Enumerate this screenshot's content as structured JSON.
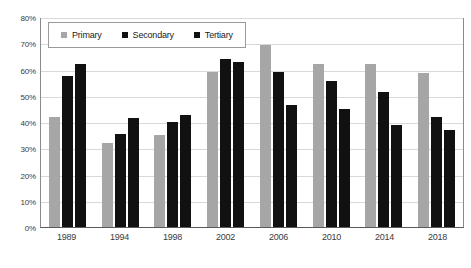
{
  "chart_data": {
    "type": "bar",
    "title": "",
    "subtitle": "",
    "xlabel": "",
    "ylabel": "",
    "categories": [
      "1989",
      "1994",
      "1998",
      "2002",
      "2006",
      "2010",
      "2014",
      "2018"
    ],
    "series": [
      {
        "name": "Primary",
        "color": "#a6a6a6",
        "values": [
          42,
          32,
          35,
          59,
          69.5,
          62,
          62,
          58.5
        ]
      },
      {
        "name": "Secondary",
        "color": "#111111",
        "values": [
          57.5,
          35.5,
          40,
          64,
          59,
          55.5,
          51.5,
          42
        ]
      },
      {
        "name": "Tertiary",
        "color": "#111111",
        "values": [
          62,
          41.5,
          42.5,
          63,
          46.5,
          45,
          39,
          37
        ]
      }
    ],
    "ylim": [
      0,
      80
    ],
    "y_ticks": [
      0,
      10,
      20,
      30,
      40,
      50,
      60,
      70,
      80
    ],
    "y_tick_labels": [
      "0%",
      "10%",
      "20%",
      "30%",
      "40%",
      "50%",
      "60%",
      "70%",
      "80%"
    ],
    "grid": true,
    "grid_axis": "y",
    "legend_position": "top-left",
    "legend_entries": [
      "Primary",
      "Secondary",
      "Tertiary"
    ]
  },
  "legend": {
    "items": [
      {
        "label": "Primary",
        "swatch_name": "legend-swatch-primary"
      },
      {
        "label": "Secondary",
        "swatch_name": "legend-swatch-secondary"
      },
      {
        "label": "Tertiary",
        "swatch_name": "legend-swatch-tertiary"
      }
    ]
  }
}
